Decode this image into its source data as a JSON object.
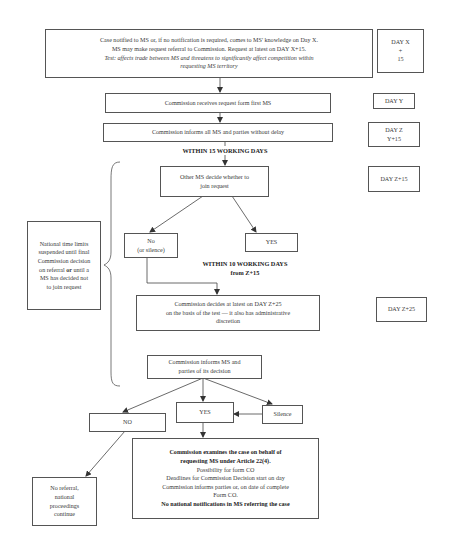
{
  "flowchart": {
    "start_box": {
      "lines": [
        "Case notified to MS or, if no notification is required, comes to MS' knowledge on Day X.",
        "MS may make request referral to Commission. Request at latest on DAY X+15."
      ],
      "test_lines": [
        "Test: affects trade between MS and threatens to significantly affect competition within",
        "requesting MS territory"
      ]
    },
    "receives_box": {
      "text": "Commission receives request form first MS"
    },
    "informs_all_box": {
      "text": "Commission informs all MS and parties without delay"
    },
    "within_15_label": {
      "text": "WITHIN 15 WORKING DAYS"
    },
    "other_ms_box": {
      "lines": [
        "Other MS decide whether to",
        "join request"
      ]
    },
    "no_silence_box": {
      "lines": [
        "No",
        "(or silence)"
      ]
    },
    "yes_join_box": {
      "text": "YES"
    },
    "within_10_label": {
      "lines": [
        "WITHIN 10 WORKING DAYS",
        "from Z+15"
      ]
    },
    "decides_box": {
      "lines": [
        "Commission decides at latest on DAY Z+25",
        "on the basis of the test — it also has administrative",
        "discretion"
      ]
    },
    "informs_decision_box": {
      "lines": [
        "Commission informs MS and",
        "parties of its decision"
      ]
    },
    "no_box": {
      "text": "NO"
    },
    "yes_box": {
      "text": "YES"
    },
    "silence_box": {
      "text": "Silence"
    },
    "examines_box": {
      "bold_lines": [
        "Commission examines the case on behalf of",
        "requesting MS under Article 22(4)."
      ],
      "lines": [
        "Possibility for form CO",
        "Deadlines for Commission Decision start on day",
        "Commission informs parties or, on date of complete",
        "Form CO."
      ],
      "bold_footer": "No national notifications in MS referring the case"
    },
    "no_referral_box": {
      "lines": [
        "No referral,",
        "national",
        "proceedings",
        "continue"
      ]
    },
    "national_limits_box": {
      "lines": [
        "National time limits",
        "suspended until final",
        "Commission decision",
        "on referral",
        "until a",
        "MS has decided not",
        "to join request"
      ],
      "bold_word": "or"
    }
  },
  "timeline": {
    "day_x": {
      "lines": [
        "DAY X",
        "+",
        "15"
      ]
    },
    "day_y": {
      "text": "DAY Y"
    },
    "day_z": {
      "lines": [
        "DAY Z",
        "Y+15"
      ]
    },
    "day_z15": {
      "text": "DAY Z+15"
    },
    "day_z25": {
      "text": "DAY Z+25"
    }
  },
  "colors": {
    "line": "#444444",
    "border": "#555555",
    "text": "#333333",
    "background": "#ffffff"
  }
}
